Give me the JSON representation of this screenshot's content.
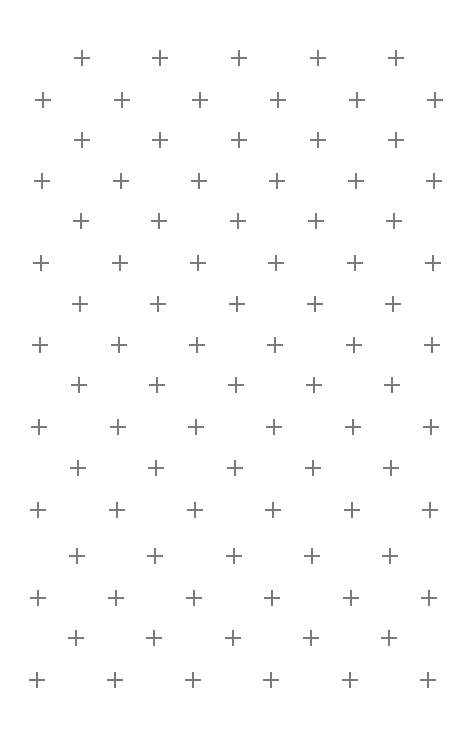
{
  "pattern": {
    "type": "staggered-plus-grid",
    "mark_color": "#7a7a7a",
    "background": "#ffffff",
    "mark_size": 16,
    "rows": [
      {
        "y": 58,
        "x": [
          82,
          160,
          239,
          318,
          396
        ]
      },
      {
        "y": 100,
        "x": [
          43,
          122,
          200,
          278,
          357,
          435
        ]
      },
      {
        "y": 140,
        "x": [
          82,
          160,
          239,
          318,
          396
        ]
      },
      {
        "y": 181,
        "x": [
          42,
          121,
          199,
          277,
          356,
          434
        ]
      },
      {
        "y": 221,
        "x": [
          81,
          159,
          238,
          316,
          394
        ]
      },
      {
        "y": 263,
        "x": [
          41,
          120,
          198,
          276,
          355,
          433
        ]
      },
      {
        "y": 304,
        "x": [
          80,
          158,
          237,
          315,
          393
        ]
      },
      {
        "y": 345,
        "x": [
          40,
          119,
          197,
          275,
          354,
          432
        ]
      },
      {
        "y": 385,
        "x": [
          79,
          157,
          236,
          314,
          392
        ]
      },
      {
        "y": 427,
        "x": [
          39,
          118,
          196,
          274,
          353,
          431
        ]
      },
      {
        "y": 468,
        "x": [
          78,
          156,
          235,
          313,
          391
        ]
      },
      {
        "y": 510,
        "x": [
          38,
          117,
          195,
          273,
          352,
          430
        ]
      },
      {
        "y": 556,
        "x": [
          77,
          155,
          234,
          312,
          390
        ]
      },
      {
        "y": 598,
        "x": [
          38,
          116,
          194,
          272,
          351,
          429
        ]
      },
      {
        "y": 638,
        "x": [
          76,
          154,
          233,
          311,
          389
        ]
      },
      {
        "y": 680,
        "x": [
          37,
          115,
          193,
          271,
          350,
          428
        ]
      }
    ]
  }
}
